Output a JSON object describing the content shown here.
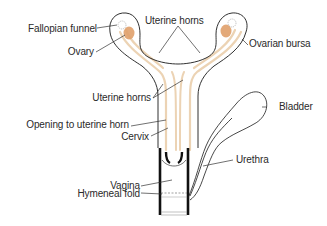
{
  "diagram": {
    "colors": {
      "outline": "#1a1a1a",
      "uterine_lining": "#ecd3b4",
      "ovary": "#e0a06a",
      "leader_line": "#333333",
      "label_text": "#2a2a2a"
    },
    "labels": {
      "fallopian_funnel": "Fallopian funnel",
      "ovary": "Ovary",
      "uterine_horns_top": "Uterine horns",
      "ovarian_bursa": "Ovarian bursa",
      "uterine_horns_mid": "Uterine horns",
      "bladder": "Bladder",
      "opening_to_uterine_horn": "Opening to uterine horn",
      "cervix": "Cervix",
      "urethra": "Urethra",
      "vagina": "Vagina",
      "hymeneal_fold": "Hymeneal fold"
    }
  }
}
